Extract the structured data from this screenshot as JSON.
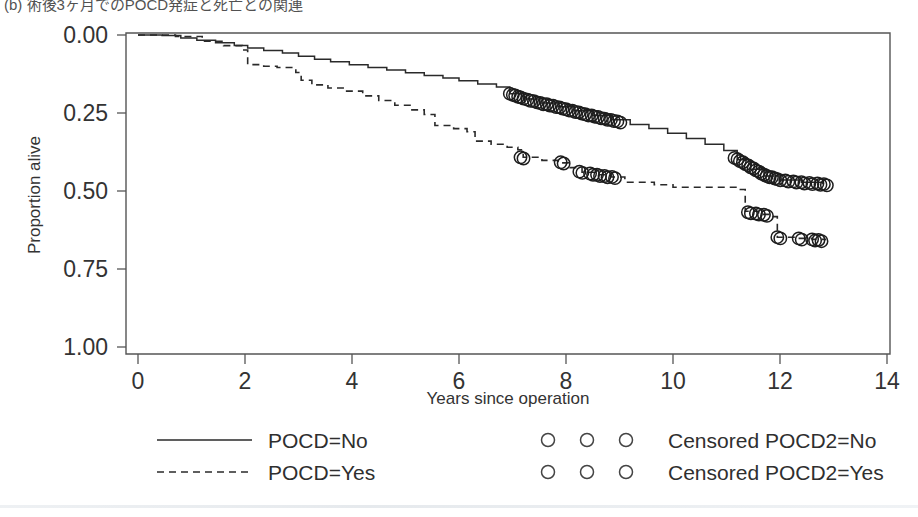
{
  "caption": {
    "text": "(b) 術後3ヶ月でのPOCD発症と死亡との関連"
  },
  "axes": {
    "y_title": "Proportion alive",
    "x_title": "Years since operation",
    "y_ticks": [
      "1.00",
      "0.75",
      "0.50",
      "0.25",
      "0.00"
    ],
    "x_ticks": [
      "0",
      "2",
      "4",
      "6",
      "8",
      "10",
      "12",
      "14"
    ]
  },
  "legend": {
    "left": [
      {
        "label": "POCD=No",
        "style": "solid"
      },
      {
        "label": "POCD=Yes",
        "style": "dashed"
      }
    ],
    "right": [
      {
        "label": "Censored POCD2=No",
        "marker": "open-circle"
      },
      {
        "label": "Censored POCD2=Yes",
        "marker": "open-circle"
      }
    ]
  },
  "colors": {
    "line": "#2a2a2a",
    "axis": "#555555",
    "text": "#333333",
    "background": "#ffffff"
  },
  "chart_data": {
    "type": "line",
    "title": "(b) 術後3ヶ月でのPOCD発症と死亡との関連",
    "xlabel": "Years since operation",
    "ylabel": "Proportion alive",
    "xlim": [
      0,
      14
    ],
    "ylim": [
      0.0,
      1.0
    ],
    "xticks": [
      0,
      2,
      4,
      6,
      8,
      10,
      12,
      14
    ],
    "yticks": [
      0.0,
      0.25,
      0.5,
      0.75,
      1.0
    ],
    "grid": false,
    "legend_position": "below-axes",
    "series": [
      {
        "name": "POCD=No",
        "style": "solid",
        "points": [
          [
            0.0,
            1.0
          ],
          [
            0.45,
            0.998
          ],
          [
            0.8,
            0.99
          ],
          [
            1.1,
            0.983
          ],
          [
            1.45,
            0.975
          ],
          [
            1.8,
            0.966
          ],
          [
            2.05,
            0.958
          ],
          [
            2.35,
            0.95
          ],
          [
            2.7,
            0.942
          ],
          [
            3.0,
            0.932
          ],
          [
            3.3,
            0.922
          ],
          [
            3.6,
            0.914
          ],
          [
            3.95,
            0.905
          ],
          [
            4.3,
            0.896
          ],
          [
            4.65,
            0.888
          ],
          [
            5.0,
            0.879
          ],
          [
            5.35,
            0.87
          ],
          [
            5.7,
            0.862
          ],
          [
            6.0,
            0.853
          ],
          [
            6.35,
            0.843
          ],
          [
            6.7,
            0.833
          ],
          [
            6.95,
            0.812
          ],
          [
            7.2,
            0.795
          ],
          [
            7.5,
            0.782
          ],
          [
            7.85,
            0.77
          ],
          [
            8.15,
            0.757
          ],
          [
            8.5,
            0.742
          ],
          [
            8.85,
            0.728
          ],
          [
            9.2,
            0.713
          ],
          [
            9.55,
            0.7
          ],
          [
            9.9,
            0.685
          ],
          [
            10.25,
            0.668
          ],
          [
            10.6,
            0.65
          ],
          [
            10.95,
            0.63
          ],
          [
            11.2,
            0.6
          ],
          [
            11.45,
            0.57
          ],
          [
            11.7,
            0.548
          ],
          [
            12.0,
            0.535
          ],
          [
            12.4,
            0.528
          ],
          [
            12.8,
            0.522
          ]
        ],
        "censored": [
          [
            6.95,
            0.812
          ],
          [
            7.05,
            0.806
          ],
          [
            7.15,
            0.8
          ],
          [
            7.28,
            0.793
          ],
          [
            7.4,
            0.788
          ],
          [
            7.52,
            0.782
          ],
          [
            7.64,
            0.778
          ],
          [
            7.76,
            0.773
          ],
          [
            7.88,
            0.768
          ],
          [
            8.0,
            0.762
          ],
          [
            8.12,
            0.757
          ],
          [
            8.24,
            0.752
          ],
          [
            8.36,
            0.746
          ],
          [
            8.48,
            0.742
          ],
          [
            8.6,
            0.737
          ],
          [
            8.72,
            0.732
          ],
          [
            8.84,
            0.728
          ],
          [
            8.96,
            0.723
          ],
          [
            11.15,
            0.606
          ],
          [
            11.25,
            0.596
          ],
          [
            11.35,
            0.586
          ],
          [
            11.45,
            0.576
          ],
          [
            11.55,
            0.566
          ],
          [
            11.65,
            0.556
          ],
          [
            11.75,
            0.548
          ],
          [
            11.85,
            0.544
          ],
          [
            11.95,
            0.538
          ],
          [
            12.1,
            0.534
          ],
          [
            12.25,
            0.531
          ],
          [
            12.4,
            0.528
          ],
          [
            12.55,
            0.526
          ],
          [
            12.7,
            0.524
          ],
          [
            12.82,
            0.522
          ]
        ]
      },
      {
        "name": "POCD=Yes",
        "style": "dashed",
        "points": [
          [
            0.0,
            1.0
          ],
          [
            0.7,
            0.995
          ],
          [
            1.2,
            0.98
          ],
          [
            1.6,
            0.966
          ],
          [
            1.95,
            0.952
          ],
          [
            2.05,
            0.905
          ],
          [
            2.35,
            0.9
          ],
          [
            2.6,
            0.896
          ],
          [
            2.95,
            0.88
          ],
          [
            3.05,
            0.855
          ],
          [
            3.25,
            0.84
          ],
          [
            3.55,
            0.83
          ],
          [
            3.9,
            0.82
          ],
          [
            4.2,
            0.805
          ],
          [
            4.5,
            0.79
          ],
          [
            4.8,
            0.775
          ],
          [
            5.1,
            0.76
          ],
          [
            5.35,
            0.745
          ],
          [
            5.55,
            0.71
          ],
          [
            5.9,
            0.7
          ],
          [
            6.15,
            0.69
          ],
          [
            6.3,
            0.66
          ],
          [
            6.6,
            0.65
          ],
          [
            6.9,
            0.64
          ],
          [
            7.1,
            0.632
          ],
          [
            7.2,
            0.608
          ],
          [
            7.55,
            0.598
          ],
          [
            7.85,
            0.59
          ],
          [
            8.05,
            0.575
          ],
          [
            8.3,
            0.56
          ],
          [
            8.55,
            0.552
          ],
          [
            8.85,
            0.545
          ],
          [
            9.1,
            0.528
          ],
          [
            9.65,
            0.52
          ],
          [
            10.0,
            0.512
          ],
          [
            11.2,
            0.505
          ],
          [
            11.35,
            0.435
          ],
          [
            11.6,
            0.425
          ],
          [
            11.85,
            0.418
          ],
          [
            11.95,
            0.352
          ],
          [
            12.3,
            0.348
          ],
          [
            12.6,
            0.345
          ],
          [
            12.85,
            0.342
          ]
        ],
        "censored": [
          [
            7.15,
            0.608
          ],
          [
            7.9,
            0.592
          ],
          [
            8.25,
            0.562
          ],
          [
            8.45,
            0.556
          ],
          [
            8.58,
            0.552
          ],
          [
            8.72,
            0.548
          ],
          [
            8.86,
            0.545
          ],
          [
            11.4,
            0.432
          ],
          [
            11.55,
            0.428
          ],
          [
            11.7,
            0.424
          ],
          [
            11.95,
            0.352
          ],
          [
            12.35,
            0.348
          ],
          [
            12.6,
            0.345
          ],
          [
            12.72,
            0.343
          ]
        ]
      }
    ]
  }
}
